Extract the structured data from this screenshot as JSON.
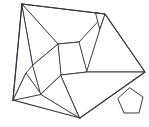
{
  "figure": {
    "background_color": "#ffffff",
    "stroke_color": "#3a3a44",
    "fill_color": "#ffffff",
    "stroke_width": 1,
    "width": 149,
    "height": 127,
    "shape_count": 10,
    "main_outline": {
      "name": "main-polygon-outline",
      "points": "22,4 105,14 145,72 80,118 13,100"
    },
    "pieces": [
      {
        "id": "piece-1",
        "name": "left-quadrilateral",
        "points": "22,4 33,65 26,73 13,100"
      },
      {
        "id": "piece-2",
        "name": "top-large-triangle",
        "points": "22,4 105,14 79,42 58,44"
      },
      {
        "id": "piece-3",
        "name": "upper-inner-triangle",
        "points": "22,4 58,44 33,65"
      },
      {
        "id": "piece-4",
        "name": "top-right-small-triangle",
        "points": "96,13 105,14 100,29"
      },
      {
        "id": "piece-5",
        "name": "right-upper-quadrilateral",
        "points": "100,29 105,14 145,72 87,72"
      },
      {
        "id": "piece-6",
        "name": "central-quadrilateral",
        "points": "58,44 79,42 87,72 61,75"
      },
      {
        "id": "piece-7",
        "name": "center-left-parallelogram",
        "points": "33,65 58,44 61,75 41,94"
      },
      {
        "id": "piece-8",
        "name": "bottom-left-triangle",
        "points": "13,100 26,73 41,94"
      },
      {
        "id": "piece-9",
        "name": "bottom-small-triangle",
        "points": "41,94 61,75 80,118"
      },
      {
        "id": "piece-10",
        "name": "bottom-right-quadrilateral",
        "points": "61,75 87,72 145,72 80,118"
      }
    ],
    "detached_piece": {
      "id": "piece-pentagon",
      "name": "detached-pentagon",
      "points": "130,88 143,97 139,113 124,113 118,99"
    }
  }
}
